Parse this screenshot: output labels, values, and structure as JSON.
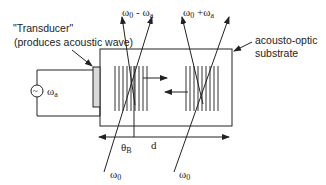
{
  "labels": {
    "transducer_title": "\"Transducer\"",
    "transducer_desc": "(produces acoustic wave)",
    "substrate_line1": "acousto-optic",
    "substrate_line2": "substrate",
    "source_symbol": "~",
    "source_freq": "ω",
    "source_freq_sub": "a",
    "beam_left_top": "ω",
    "beam_left_top_sub": "0",
    "beam_left_top_op": " - ω",
    "beam_left_top_sub2": "a",
    "beam_right_top": "ω",
    "beam_right_top_sub": "0",
    "beam_right_top_op": " +ω",
    "beam_right_top_sub2": "a",
    "beam_left_bottom": "ω",
    "beam_left_bottom_sub": "0",
    "beam_right_bottom": "ω",
    "beam_right_bottom_sub": "0",
    "bragg_angle": "θ",
    "bragg_angle_sub": "B",
    "distance": "d"
  },
  "colors": {
    "line": "#222222",
    "transducer_fill": "#d9d9d9",
    "background": "#ffffff"
  }
}
